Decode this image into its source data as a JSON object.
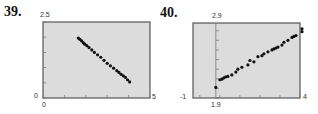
{
  "charts": [
    {
      "number": "39.",
      "ymax_label": "2.5",
      "ymin_label": "0",
      "xmin_label": "0",
      "xmax_label": "5"
    },
    {
      "number": "40.",
      "ymax_label": "2.9",
      "ymin_label": "-1",
      "xaxis_label": "1.9",
      "xmax_label": "4"
    }
  ],
  "colors": {
    "plot_bg": "#dcdcdc",
    "border": "#555555",
    "point": "#111111"
  },
  "chart_data": [
    {
      "type": "scatter",
      "title": "39.",
      "xlim": [
        0,
        5
      ],
      "ylim": [
        0,
        2.5
      ],
      "x": [
        1.65,
        1.72,
        1.8,
        1.88,
        1.95,
        2.05,
        2.15,
        2.28,
        2.4,
        2.55,
        2.7,
        2.85,
        3.0,
        3.15,
        3.3,
        3.45,
        3.55,
        3.65,
        3.75,
        3.85,
        3.95,
        4.05
      ],
      "y": [
        1.97,
        1.93,
        1.88,
        1.82,
        1.77,
        1.72,
        1.66,
        1.58,
        1.5,
        1.42,
        1.34,
        1.24,
        1.14,
        1.06,
        0.98,
        0.9,
        0.84,
        0.78,
        0.73,
        0.68,
        0.6,
        0.53
      ]
    },
    {
      "type": "scatter",
      "title": "40.",
      "xlim": [
        1.33,
        4
      ],
      "ylim": [
        -1,
        2.9
      ],
      "x": [
        1.9,
        2.0,
        2.05,
        2.1,
        2.15,
        2.2,
        2.3,
        2.4,
        2.45,
        2.55,
        2.7,
        2.75,
        2.85,
        2.95,
        3.05,
        3.1,
        3.2,
        3.3,
        3.35,
        3.4,
        3.45,
        3.55,
        3.6,
        3.7,
        3.8,
        3.85,
        3.9,
        4.05,
        4.05
      ],
      "y": [
        -0.45,
        -0.05,
        -0.02,
        0.05,
        0.1,
        0.12,
        0.2,
        0.35,
        0.5,
        0.6,
        0.72,
        0.95,
        0.88,
        1.15,
        1.2,
        1.3,
        1.4,
        1.5,
        1.55,
        1.6,
        1.65,
        1.75,
        1.9,
        2.0,
        2.15,
        2.2,
        2.25,
        2.45,
        2.6
      ]
    }
  ]
}
